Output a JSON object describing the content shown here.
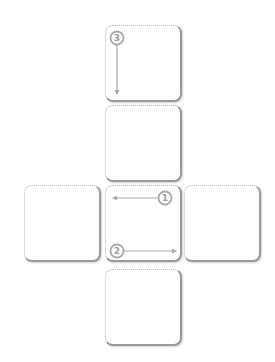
{
  "diagram": {
    "colors": {
      "card_border": "#9a9a9a",
      "card_dots": "#b8b8b8",
      "arrow": "#aaaaaa",
      "background": "#ffffff"
    },
    "faces": [
      {
        "id": "top",
        "x": 105,
        "y": 25,
        "w": 77,
        "h": 77
      },
      {
        "id": "upper-middle",
        "x": 105,
        "y": 105,
        "w": 77,
        "h": 77
      },
      {
        "id": "left",
        "x": 24,
        "y": 185,
        "w": 77,
        "h": 77
      },
      {
        "id": "center",
        "x": 105,
        "y": 185,
        "w": 77,
        "h": 77
      },
      {
        "id": "right",
        "x": 184,
        "y": 185,
        "w": 77,
        "h": 77
      },
      {
        "id": "bottom",
        "x": 105,
        "y": 269,
        "w": 77,
        "h": 77
      }
    ],
    "markers": [
      {
        "label": "1",
        "face": "center",
        "direction": "left"
      },
      {
        "label": "2",
        "face": "center",
        "direction": "right"
      },
      {
        "label": "3",
        "face": "top",
        "direction": "down"
      }
    ]
  }
}
